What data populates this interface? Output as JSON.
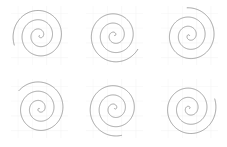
{
  "figure": {
    "title": "",
    "width": 227,
    "height": 147,
    "background_color": "#ffffff",
    "rows": 2,
    "cols": 3,
    "panel_count": 6
  },
  "style": {
    "spiral_color": "#8c8c8c",
    "spiral_linewidth": 0.8,
    "grid_color": "#f2f2f2",
    "grid_linewidth": 0.5,
    "axes_facecolor": "#ffffff",
    "spine_visible": false,
    "ticks_visible": false,
    "tick_labels_visible": false
  },
  "chart_data": {
    "type": "line",
    "title": "",
    "subtitle": "",
    "xlabel": "",
    "ylabel": "",
    "grid": true,
    "legend": null,
    "legend_position": "none",
    "shared_parameters": {
      "curve_family": "archimedean",
      "equation": "r = a * theta",
      "a": 1.0,
      "theta_start_rad": 0.0,
      "theta_end_rad": 18.85,
      "turns": 3.0,
      "sample_points": 600,
      "xlim": [
        -20,
        20
      ],
      "ylim": [
        -20,
        20
      ],
      "grid_ticks_x": [
        -15,
        -5,
        5,
        15
      ],
      "grid_ticks_y": [
        -15,
        -5,
        5,
        15
      ]
    },
    "panels": [
      {
        "index": 0,
        "row": 0,
        "col": 0,
        "label": "",
        "phase_deg": 200,
        "gap_location": "upper-left",
        "series": [
          {
            "name": "spiral-1",
            "color": "#8c8c8c",
            "turns": 3.0,
            "phase_deg": 200
          }
        ]
      },
      {
        "index": 1,
        "row": 0,
        "col": 1,
        "label": "",
        "phase_deg": 330,
        "gap_location": "upper-right",
        "series": [
          {
            "name": "spiral-2",
            "color": "#8c8c8c",
            "turns": 3.0,
            "phase_deg": 330
          }
        ]
      },
      {
        "index": 2,
        "row": 0,
        "col": 2,
        "label": "",
        "phase_deg": 95,
        "gap_location": "lower-left",
        "series": [
          {
            "name": "spiral-3",
            "color": "#8c8c8c",
            "turns": 3.0,
            "phase_deg": 95
          }
        ]
      },
      {
        "index": 3,
        "row": 1,
        "col": 0,
        "label": "",
        "phase_deg": 140,
        "gap_location": "lower-left",
        "series": [
          {
            "name": "spiral-4",
            "color": "#8c8c8c",
            "turns": 3.0,
            "phase_deg": 140
          }
        ]
      },
      {
        "index": 4,
        "row": 1,
        "col": 1,
        "label": "",
        "phase_deg": 285,
        "gap_location": "top",
        "series": [
          {
            "name": "spiral-5",
            "color": "#8c8c8c",
            "turns": 3.0,
            "phase_deg": 285
          }
        ]
      },
      {
        "index": 5,
        "row": 1,
        "col": 2,
        "label": "",
        "phase_deg": 20,
        "gap_location": "lower-right",
        "series": [
          {
            "name": "spiral-6",
            "color": "#8c8c8c",
            "turns": 3.0,
            "phase_deg": 20
          }
        ]
      }
    ]
  }
}
